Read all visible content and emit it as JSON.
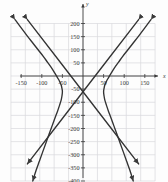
{
  "chart_data": {
    "type": "line",
    "title": "",
    "subtitle": "",
    "xlabel": "x",
    "ylabel": "y",
    "xlim": [
      -175,
      175
    ],
    "ylim": [
      -400,
      215
    ],
    "grid": true,
    "legend": false,
    "x_ticks": [
      -150,
      -100,
      -50,
      50,
      100,
      150
    ],
    "x_tick_labels": [
      "-150",
      "-100",
      "-50",
      "50",
      "100",
      "150"
    ],
    "y_ticks": [
      200,
      150,
      100,
      50,
      -50,
      -100,
      -150,
      -200,
      -250,
      -300,
      -350,
      -400
    ],
    "y_tick_labels": [
      "200",
      "150",
      "100",
      "50",
      "-50",
      "-100",
      "-150",
      "-200",
      "-250",
      "-300",
      "-350",
      "-400"
    ],
    "x_grid_lines": [
      -175,
      -140,
      -105,
      -70,
      -35,
      0,
      35,
      70,
      105,
      140,
      175
    ],
    "y_grid_lines": [
      200,
      150,
      100,
      50,
      0,
      -50,
      -100,
      -150,
      -200,
      -250,
      -300,
      -350,
      -400
    ],
    "series": [
      {
        "name": "hyperbola-left-branch",
        "color": "#333333",
        "arrow_start": true,
        "arrow_end": true,
        "points": [
          [
            -165,
            215
          ],
          [
            -150,
            183
          ],
          [
            -135,
            152
          ],
          [
            -120,
            122
          ],
          [
            -108,
            98
          ],
          [
            -96,
            74
          ],
          [
            -86,
            52
          ],
          [
            -76,
            30
          ],
          [
            -68,
            10
          ],
          [
            -62,
            -6
          ],
          [
            -57,
            -20
          ],
          [
            -53,
            -34
          ],
          [
            -51,
            -48
          ],
          [
            -50,
            -60
          ],
          [
            -51,
            -75
          ],
          [
            -53,
            -92
          ],
          [
            -57,
            -112
          ],
          [
            -62,
            -135
          ],
          [
            -68,
            -160
          ],
          [
            -75,
            -190
          ],
          [
            -82,
            -220
          ],
          [
            -90,
            -255
          ],
          [
            -98,
            -290
          ],
          [
            -106,
            -325
          ],
          [
            -114,
            -360
          ],
          [
            -122,
            -400
          ]
        ]
      },
      {
        "name": "hyperbola-right-branch",
        "color": "#333333",
        "arrow_start": true,
        "arrow_end": true,
        "points": [
          [
            165,
            215
          ],
          [
            150,
            183
          ],
          [
            135,
            152
          ],
          [
            120,
            122
          ],
          [
            108,
            98
          ],
          [
            96,
            74
          ],
          [
            86,
            52
          ],
          [
            76,
            30
          ],
          [
            68,
            10
          ],
          [
            62,
            -6
          ],
          [
            57,
            -20
          ],
          [
            53,
            -34
          ],
          [
            51,
            -48
          ],
          [
            50,
            -60
          ],
          [
            51,
            -75
          ],
          [
            53,
            -92
          ],
          [
            57,
            -112
          ],
          [
            62,
            -135
          ],
          [
            68,
            -160
          ],
          [
            75,
            -190
          ],
          [
            82,
            -220
          ],
          [
            90,
            -255
          ],
          [
            98,
            -290
          ],
          [
            106,
            -325
          ],
          [
            114,
            -360
          ],
          [
            122,
            -400
          ]
        ]
      },
      {
        "name": "asymptote-positive-slope",
        "color": "#333333",
        "arrow_start": true,
        "arrow_end": true,
        "points": [
          [
            -135,
            215
          ],
          [
            0,
            -60
          ],
          [
            135,
            -335
          ]
        ]
      },
      {
        "name": "asymptote-negative-slope",
        "color": "#333333",
        "arrow_start": true,
        "arrow_end": true,
        "points": [
          [
            135,
            215
          ],
          [
            0,
            -60
          ],
          [
            -135,
            -335
          ]
        ]
      }
    ]
  },
  "axes": {
    "x_axis_label": "x",
    "y_axis_label": "y",
    "origin_label": "0"
  }
}
